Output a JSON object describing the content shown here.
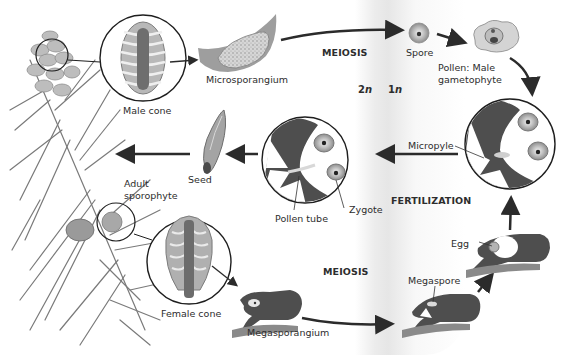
{
  "diagram": {
    "colors": {
      "background": "#ffffff",
      "tissue_dark": "#4a4a4a",
      "tissue_mid": "#8a8a8a",
      "tissue_light": "#cfcfcf",
      "band": "#e8e8e8",
      "arrow": "#2b2b2b",
      "text": "#2d2d2d"
    },
    "phase_labels": {
      "meiosis_top": "MEIOSIS",
      "meiosis_bottom": "MEIOSIS",
      "fertilization": "FERTILIZATION",
      "diploid": "2n",
      "haploid": "1n"
    },
    "labels": {
      "male_cone": "Male cone",
      "microsporangium": "Microsporangium",
      "spore": "Spore",
      "pollen_line1": "Pollen: Male",
      "pollen_line2": "gametophyte",
      "micropyle": "Micropyle",
      "seed": "Seed",
      "adult_line1": "Adult",
      "adult_line2": "sporophyte",
      "pollen_tube": "Pollen tube",
      "zygote": "Zygote",
      "egg": "Egg",
      "female_cone": "Female cone",
      "megasporangium": "Megasporangium",
      "megaspore": "Megaspore"
    },
    "icons": [
      "pine-branch-icon",
      "male-cone-icon",
      "microsporangium-icon",
      "spore-icon",
      "pollen-grain-icon",
      "ovule-pollination-icon",
      "zygote-ovule-icon",
      "seed-icon",
      "female-cone-icon",
      "megasporangium-icon",
      "megaspore-ovule-icon",
      "egg-ovule-icon"
    ]
  }
}
